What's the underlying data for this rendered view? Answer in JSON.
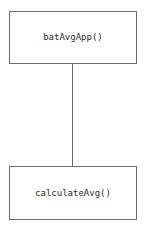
{
  "diagram": {
    "type": "structure-chart",
    "background_color": "#ffffff",
    "border_color": "#6c6c6c",
    "text_color": "#2b2b2b",
    "modules": [
      {
        "id": "parent",
        "label": "batAvgApp()",
        "role": "main-module",
        "x": 9,
        "y": 11,
        "width": 128,
        "height": 53
      },
      {
        "id": "child",
        "label": "calculateAvg()",
        "role": "sub-module",
        "x": 9,
        "y": 166,
        "width": 128,
        "height": 54
      }
    ],
    "connectors": [
      {
        "id": "parent-child",
        "from": "parent",
        "to": "child",
        "orientation": "vertical",
        "x": 72,
        "y": 64,
        "length": 102
      }
    ]
  }
}
